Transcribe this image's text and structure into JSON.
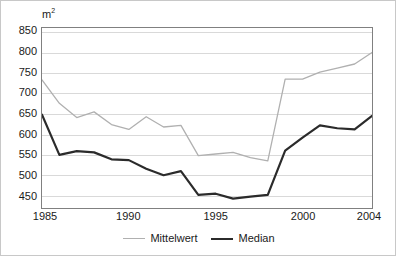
{
  "chart_data": {
    "type": "line",
    "title": "",
    "subtitle": "",
    "xlabel": "",
    "ylabel": "",
    "unit_label": "m",
    "unit_exponent": "2",
    "x": [
      1985,
      1986,
      1987,
      1988,
      1989,
      1990,
      1991,
      1992,
      1993,
      1994,
      1995,
      1996,
      1997,
      1998,
      1999,
      2000,
      2001,
      2002,
      2003,
      2004
    ],
    "xlim": [
      1985,
      2004
    ],
    "ylim": [
      420,
      860
    ],
    "yticks": [
      450,
      500,
      550,
      600,
      650,
      700,
      750,
      800,
      850
    ],
    "xticks": [
      1985,
      1990,
      1995,
      2000,
      2004
    ],
    "xtick_labels": [
      "1985",
      "1990",
      "1995",
      "2000",
      "2004"
    ],
    "ytick_labels": [
      "850",
      "800",
      "750",
      "700",
      "650",
      "600",
      "550",
      "500",
      "450"
    ],
    "grid": "horizontal",
    "legend_position": "bottom-center",
    "series": [
      {
        "name": "Mittelwert",
        "color": "#b0b0b0",
        "width": 1.3,
        "values": [
          733,
          676,
          641,
          655,
          624,
          612,
          643,
          618,
          622,
          548,
          552,
          556,
          543,
          535,
          735,
          735,
          752,
          762,
          772,
          800
        ]
      },
      {
        "name": "Median",
        "color": "#2b2b2b",
        "width": 2.2,
        "values": [
          648,
          550,
          559,
          556,
          539,
          537,
          516,
          500,
          510,
          452,
          455,
          443,
          448,
          452,
          560,
          592,
          622,
          615,
          612,
          645
        ]
      }
    ]
  },
  "legend": {
    "entries": [
      {
        "label": "Mittelwert"
      },
      {
        "label": "Median"
      }
    ]
  },
  "colors": {
    "mittelwert": "#b0b0b0",
    "median": "#2b2b2b",
    "gridline": "#d9d9d9",
    "axis": "#808080",
    "text": "#1a1a1a",
    "background": "#ffffff",
    "border": "#c8c8c8"
  }
}
